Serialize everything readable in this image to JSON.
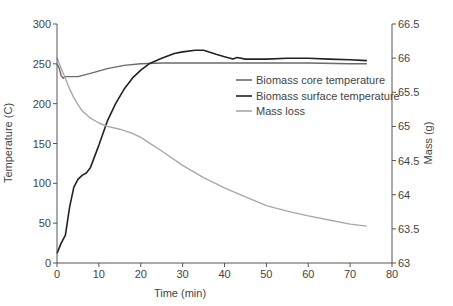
{
  "chart_data": {
    "type": "line",
    "title": "",
    "xlabel": "Time (min)",
    "ylabel": "Temperature (C)",
    "y2label": "Mass (g)",
    "xlim": [
      0,
      80
    ],
    "ylim": [
      0,
      300
    ],
    "y2lim": [
      63,
      66.5
    ],
    "xticks": [
      0,
      10,
      20,
      30,
      40,
      50,
      60,
      70,
      80
    ],
    "yticks": [
      0,
      50,
      100,
      150,
      200,
      250,
      300
    ],
    "y2ticks": [
      "63",
      "63.5",
      "64",
      "64.5",
      "65",
      "65.5",
      "66",
      "66.5"
    ],
    "grid": false,
    "legend_position": "upper right (inside)",
    "series": [
      {
        "name": "Biomass core temperature",
        "axis": "left",
        "color": "#6b6b6b",
        "x": [
          0,
          0.5,
          1,
          1.5,
          2,
          3,
          5,
          8,
          12,
          16,
          20,
          25,
          30,
          40,
          50,
          60,
          70,
          74
        ],
        "values": [
          250,
          245,
          235,
          232,
          234,
          234,
          234,
          238,
          244,
          248,
          250,
          251,
          251,
          251,
          251,
          251,
          250,
          250
        ]
      },
      {
        "name": "Biomass surface temperature",
        "axis": "left",
        "color": "#222222",
        "x": [
          0,
          1,
          2,
          3,
          4,
          5,
          6,
          7,
          8,
          10,
          12,
          14,
          16,
          18,
          20,
          22,
          25,
          28,
          30,
          33,
          35,
          38,
          40,
          42,
          43,
          45,
          50,
          55,
          60,
          65,
          70,
          74
        ],
        "values": [
          12,
          25,
          35,
          70,
          95,
          105,
          110,
          113,
          120,
          148,
          178,
          200,
          218,
          232,
          242,
          250,
          257,
          263,
          265,
          267,
          267,
          262,
          259,
          256,
          258,
          256,
          256,
          257,
          257,
          256,
          255,
          254
        ]
      },
      {
        "name": "Mass loss",
        "axis": "right",
        "color": "#a8a8a8",
        "x": [
          0,
          1,
          2,
          3,
          4,
          5,
          6,
          8,
          10,
          12,
          15,
          18,
          20,
          22,
          25,
          30,
          35,
          40,
          45,
          50,
          55,
          60,
          65,
          70,
          74
        ],
        "values": [
          66.0,
          65.85,
          65.7,
          65.55,
          65.42,
          65.32,
          65.23,
          65.12,
          65.05,
          65.0,
          64.96,
          64.9,
          64.84,
          64.76,
          64.64,
          64.43,
          64.25,
          64.1,
          63.97,
          63.84,
          63.76,
          63.69,
          63.63,
          63.57,
          63.54
        ]
      }
    ]
  }
}
